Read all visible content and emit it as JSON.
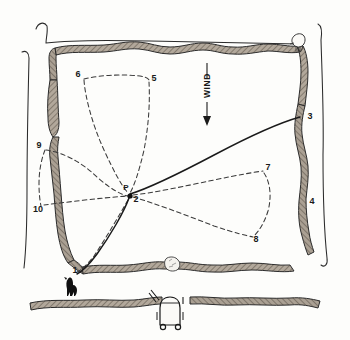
{
  "figure": {
    "wind_label": "WIND",
    "station_label": "P",
    "colors": {
      "ink": "#1a1a1a",
      "wall_fill": "#8d8378",
      "wall_shadow": "#5e564d",
      "paper": "#fdfdfb"
    }
  },
  "point_labels": [
    {
      "id": "1",
      "text": "1",
      "x": 75,
      "y": 273
    },
    {
      "id": "2",
      "text": "2",
      "x": 135,
      "y": 199
    },
    {
      "id": "3",
      "text": "3",
      "x": 310,
      "y": 119
    },
    {
      "id": "4",
      "text": "4",
      "x": 312,
      "y": 204
    },
    {
      "id": "5",
      "text": "5",
      "x": 152,
      "y": 81
    },
    {
      "id": "6",
      "text": "6",
      "x": 78,
      "y": 77
    },
    {
      "id": "7",
      "text": "7",
      "x": 267,
      "y": 170
    },
    {
      "id": "8",
      "text": "8",
      "x": 255,
      "y": 239
    },
    {
      "id": "9",
      "text": "9",
      "x": 38,
      "y": 148
    },
    {
      "id": "10",
      "text": "10",
      "x": 36,
      "y": 209
    },
    {
      "id": "P",
      "text": "P",
      "x": 126,
      "y": 188
    }
  ],
  "features": [
    {
      "name": "dog-figure",
      "label": "dog silhouette"
    },
    {
      "name": "cart-figure",
      "label": "cart"
    },
    {
      "name": "stone-marker",
      "label": "stone in wall gap"
    },
    {
      "name": "corner-object",
      "label": "object at north-east corner"
    }
  ],
  "legend_notes": {
    "solid_line": "walked route",
    "dashed_line": "observed path"
  }
}
